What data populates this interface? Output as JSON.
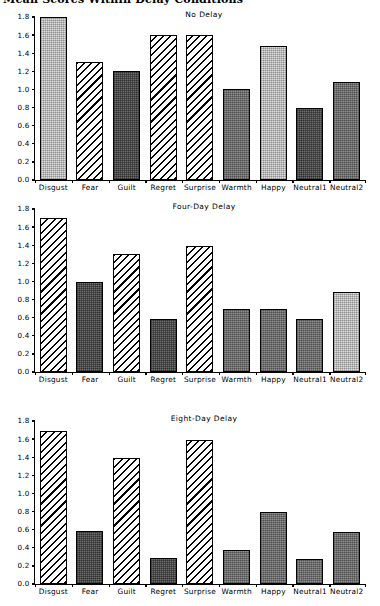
{
  "figure": {
    "main_title": "Mean Scores Within Delay Conditions",
    "categories": [
      "Disgust",
      "Fear",
      "Guilt",
      "Regret",
      "Surprise",
      "Warmth",
      "Happy",
      "Neutral1",
      "Neutral2"
    ],
    "y_ticks": [
      "1.8",
      "1.6",
      "1.4",
      "1.2",
      "1.0",
      "0.8",
      "0.6",
      "0.4",
      "0.2",
      "0.0"
    ]
  },
  "chart_data": [
    {
      "type": "bar",
      "title": "No Delay",
      "xlabel": "",
      "ylabel": "",
      "ylim": [
        0.0,
        1.8
      ],
      "grid": false,
      "legend": "none",
      "categories": [
        "Disgust",
        "Fear",
        "Guilt",
        "Regret",
        "Surprise",
        "Warmth",
        "Happy",
        "Neutral1",
        "Neutral2"
      ],
      "values": [
        1.8,
        1.3,
        1.2,
        1.6,
        1.6,
        1.0,
        1.48,
        0.79,
        1.08
      ],
      "patterns": [
        "light-dotted",
        "diagonal-hatch",
        "dark-gray",
        "diagonal-hatch",
        "diagonal-hatch",
        "medium-gray",
        "light-dotted",
        "dark-gray",
        "medium-gray"
      ]
    },
    {
      "type": "bar",
      "title": "Four-Day Delay",
      "xlabel": "",
      "ylabel": "",
      "ylim": [
        0.0,
        1.8
      ],
      "grid": false,
      "legend": "none",
      "categories": [
        "Disgust",
        "Fear",
        "Guilt",
        "Regret",
        "Surprise",
        "Warmth",
        "Happy",
        "Neutral1",
        "Neutral2"
      ],
      "values": [
        1.7,
        0.99,
        1.3,
        0.59,
        1.39,
        0.7,
        0.7,
        0.58,
        0.88
      ],
      "patterns": [
        "diagonal-hatch",
        "dark-gray",
        "diagonal-hatch",
        "dark-gray",
        "diagonal-hatch",
        "medium-gray",
        "medium-gray",
        "medium-gray",
        "light-dotted"
      ]
    },
    {
      "type": "bar",
      "title": "Eight-Day Delay",
      "xlabel": "",
      "ylabel": "",
      "ylim": [
        0.0,
        1.8
      ],
      "grid": false,
      "legend": "none",
      "categories": [
        "Disgust",
        "Fear",
        "Guilt",
        "Regret",
        "Surprise",
        "Warmth",
        "Happy",
        "Neutral1",
        "Neutral2"
      ],
      "values": [
        1.69,
        0.59,
        1.39,
        0.29,
        1.59,
        0.38,
        0.79,
        0.28,
        0.57
      ],
      "patterns": [
        "diagonal-hatch",
        "dark-gray",
        "diagonal-hatch",
        "dark-gray",
        "diagonal-hatch",
        "medium-gray",
        "medium-gray",
        "medium-gray",
        "medium-gray"
      ]
    }
  ]
}
